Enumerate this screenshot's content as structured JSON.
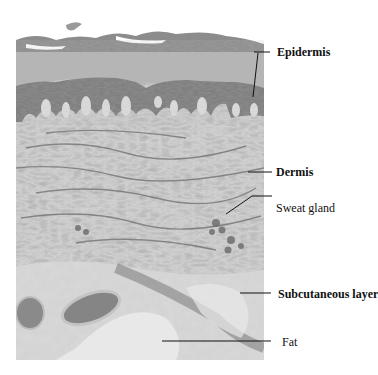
{
  "figure": {
    "labels": [
      {
        "text": "Epidermis",
        "bold": true
      },
      {
        "text": "Dermis",
        "bold": true
      },
      {
        "text": "Sweat gland",
        "bold": false
      },
      {
        "text": "Subcutaneous layer",
        "bold": true
      },
      {
        "text": "Fat",
        "bold": false
      }
    ]
  }
}
